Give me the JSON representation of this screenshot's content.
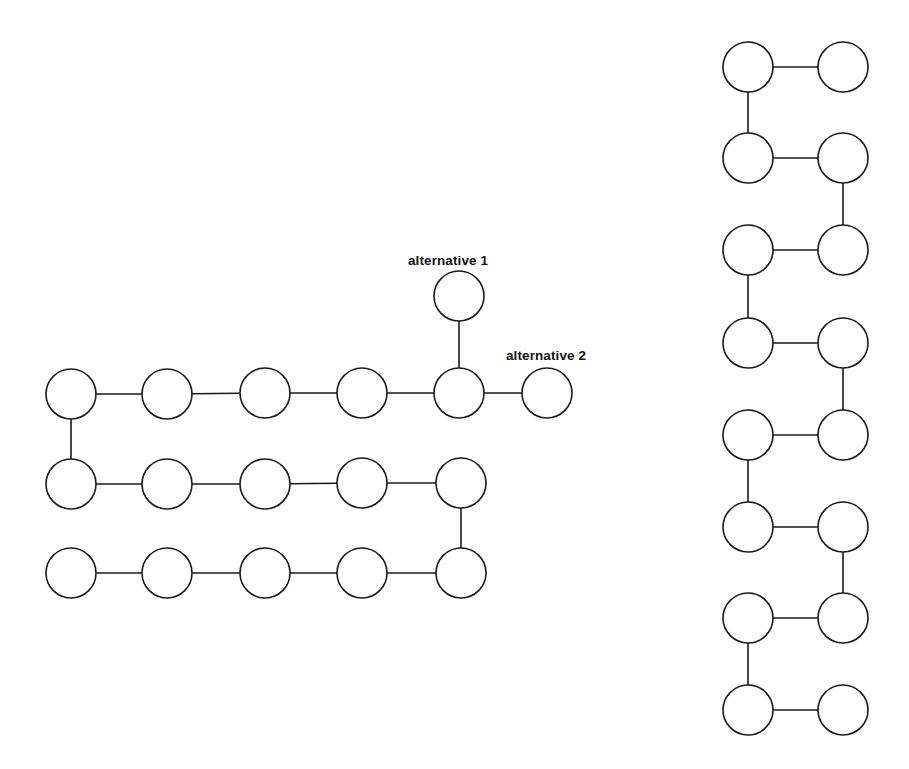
{
  "figure": {
    "title": "",
    "background_color": "#ffffff",
    "stroke_color": "#1a1a1a",
    "node_fill_color": "#ffffff",
    "node_radius": 25,
    "stroke_width": 1.6,
    "canvas": {
      "width": 909,
      "height": 769
    }
  },
  "labels": {
    "alternative_1": "alternative 1",
    "alternative_2": "alternative 2"
  },
  "chart_data": {
    "type": "diagram",
    "title": "",
    "graphs": [
      {
        "name": "left-boustrophedon-chain",
        "layout": "horizontal-serpentine",
        "rows": 3,
        "nodes": [
          {
            "id": "L-r1c1",
            "x": 71,
            "y": 394,
            "row": 1,
            "col": 1,
            "label": ""
          },
          {
            "id": "L-r1c2",
            "x": 167,
            "y": 394,
            "row": 1,
            "col": 2,
            "label": ""
          },
          {
            "id": "L-r1c3",
            "x": 265,
            "y": 393,
            "row": 1,
            "col": 3,
            "label": ""
          },
          {
            "id": "L-r1c4",
            "x": 362,
            "y": 393,
            "row": 1,
            "col": 4,
            "label": ""
          },
          {
            "id": "L-r1c5",
            "x": 459,
            "y": 393,
            "row": 1,
            "col": 5,
            "label": ""
          },
          {
            "id": "L-alt2",
            "x": 547,
            "y": 393,
            "row": 1,
            "col": 6,
            "label": "alternative 2"
          },
          {
            "id": "L-alt1",
            "x": 459,
            "y": 296,
            "row": 0,
            "col": 5,
            "label": "alternative 1"
          },
          {
            "id": "L-r2c1",
            "x": 71,
            "y": 484,
            "row": 2,
            "col": 1,
            "label": ""
          },
          {
            "id": "L-r2c2",
            "x": 167,
            "y": 484,
            "row": 2,
            "col": 2,
            "label": ""
          },
          {
            "id": "L-r2c3",
            "x": 265,
            "y": 484,
            "row": 2,
            "col": 3,
            "label": ""
          },
          {
            "id": "L-r2c4",
            "x": 362,
            "y": 483,
            "row": 2,
            "col": 4,
            "label": ""
          },
          {
            "id": "L-r2c5",
            "x": 461,
            "y": 483,
            "row": 2,
            "col": 5,
            "label": ""
          },
          {
            "id": "L-r3c1",
            "x": 71,
            "y": 573,
            "row": 3,
            "col": 1,
            "label": ""
          },
          {
            "id": "L-r3c2",
            "x": 167,
            "y": 573,
            "row": 3,
            "col": 2,
            "label": ""
          },
          {
            "id": "L-r3c3",
            "x": 265,
            "y": 573,
            "row": 3,
            "col": 3,
            "label": ""
          },
          {
            "id": "L-r3c4",
            "x": 362,
            "y": 573,
            "row": 3,
            "col": 4,
            "label": ""
          },
          {
            "id": "L-r3c5",
            "x": 461,
            "y": 573,
            "row": 3,
            "col": 5,
            "label": ""
          }
        ],
        "edges": [
          {
            "from": "L-r3c1",
            "to": "L-r3c2",
            "kind": "horizontal"
          },
          {
            "from": "L-r3c2",
            "to": "L-r3c3",
            "kind": "horizontal"
          },
          {
            "from": "L-r3c3",
            "to": "L-r3c4",
            "kind": "horizontal"
          },
          {
            "from": "L-r3c4",
            "to": "L-r3c5",
            "kind": "horizontal"
          },
          {
            "from": "L-r3c5",
            "to": "L-r2c5",
            "kind": "vertical"
          },
          {
            "from": "L-r2c5",
            "to": "L-r2c4",
            "kind": "horizontal"
          },
          {
            "from": "L-r2c4",
            "to": "L-r2c3",
            "kind": "horizontal"
          },
          {
            "from": "L-r2c3",
            "to": "L-r2c2",
            "kind": "horizontal"
          },
          {
            "from": "L-r2c2",
            "to": "L-r2c1",
            "kind": "horizontal"
          },
          {
            "from": "L-r2c1",
            "to": "L-r1c1",
            "kind": "vertical"
          },
          {
            "from": "L-r1c1",
            "to": "L-r1c2",
            "kind": "horizontal"
          },
          {
            "from": "L-r1c2",
            "to": "L-r1c3",
            "kind": "horizontal"
          },
          {
            "from": "L-r1c3",
            "to": "L-r1c4",
            "kind": "horizontal"
          },
          {
            "from": "L-r1c4",
            "to": "L-r1c5",
            "kind": "horizontal"
          },
          {
            "from": "L-r1c5",
            "to": "L-alt1",
            "kind": "vertical-branch"
          },
          {
            "from": "L-r1c5",
            "to": "L-alt2",
            "kind": "horizontal-branch"
          }
        ]
      },
      {
        "name": "right-serpentine-ladder",
        "layout": "vertical-serpentine",
        "rows": 8,
        "columns_x": [
          748,
          843
        ],
        "rows_y": [
          67,
          158,
          250,
          343,
          435,
          527,
          618,
          710
        ],
        "nodes": [
          {
            "id": "R-r1L",
            "x": 748,
            "y": 67,
            "row": 1,
            "col": "left",
            "label": ""
          },
          {
            "id": "R-r1R",
            "x": 843,
            "y": 67,
            "row": 1,
            "col": "right",
            "label": ""
          },
          {
            "id": "R-r2L",
            "x": 748,
            "y": 158,
            "row": 2,
            "col": "left",
            "label": ""
          },
          {
            "id": "R-r2R",
            "x": 843,
            "y": 158,
            "row": 2,
            "col": "right",
            "label": ""
          },
          {
            "id": "R-r3L",
            "x": 748,
            "y": 250,
            "row": 3,
            "col": "left",
            "label": ""
          },
          {
            "id": "R-r3R",
            "x": 843,
            "y": 250,
            "row": 3,
            "col": "right",
            "label": ""
          },
          {
            "id": "R-r4L",
            "x": 748,
            "y": 343,
            "row": 4,
            "col": "left",
            "label": ""
          },
          {
            "id": "R-r4R",
            "x": 843,
            "y": 343,
            "row": 4,
            "col": "right",
            "label": ""
          },
          {
            "id": "R-r5L",
            "x": 748,
            "y": 435,
            "row": 5,
            "col": "left",
            "label": ""
          },
          {
            "id": "R-r5R",
            "x": 843,
            "y": 435,
            "row": 5,
            "col": "right",
            "label": ""
          },
          {
            "id": "R-r6L",
            "x": 748,
            "y": 527,
            "row": 6,
            "col": "left",
            "label": ""
          },
          {
            "id": "R-r6R",
            "x": 843,
            "y": 527,
            "row": 6,
            "col": "right",
            "label": ""
          },
          {
            "id": "R-r7L",
            "x": 748,
            "y": 618,
            "row": 7,
            "col": "left",
            "label": ""
          },
          {
            "id": "R-r7R",
            "x": 843,
            "y": 618,
            "row": 7,
            "col": "right",
            "label": ""
          },
          {
            "id": "R-r8L",
            "x": 748,
            "y": 710,
            "row": 8,
            "col": "left",
            "label": ""
          },
          {
            "id": "R-r8R",
            "x": 843,
            "y": 710,
            "row": 8,
            "col": "right",
            "label": ""
          }
        ],
        "edges": [
          {
            "from": "R-r1R",
            "to": "R-r1L",
            "kind": "horizontal"
          },
          {
            "from": "R-r1L",
            "to": "R-r2L",
            "kind": "vertical"
          },
          {
            "from": "R-r2L",
            "to": "R-r2R",
            "kind": "horizontal"
          },
          {
            "from": "R-r2R",
            "to": "R-r3R",
            "kind": "vertical"
          },
          {
            "from": "R-r3R",
            "to": "R-r3L",
            "kind": "horizontal"
          },
          {
            "from": "R-r3L",
            "to": "R-r4L",
            "kind": "vertical"
          },
          {
            "from": "R-r4L",
            "to": "R-r4R",
            "kind": "horizontal"
          },
          {
            "from": "R-r4R",
            "to": "R-r5R",
            "kind": "vertical"
          },
          {
            "from": "R-r5R",
            "to": "R-r5L",
            "kind": "horizontal"
          },
          {
            "from": "R-r5L",
            "to": "R-r6L",
            "kind": "vertical"
          },
          {
            "from": "R-r6L",
            "to": "R-r6R",
            "kind": "horizontal"
          },
          {
            "from": "R-r6R",
            "to": "R-r7R",
            "kind": "vertical"
          },
          {
            "from": "R-r7R",
            "to": "R-r7L",
            "kind": "horizontal"
          },
          {
            "from": "R-r7L",
            "to": "R-r8L",
            "kind": "vertical"
          },
          {
            "from": "R-r8L",
            "to": "R-r8R",
            "kind": "horizontal"
          }
        ]
      }
    ],
    "annotations": [
      {
        "id": "ann-alt1",
        "text": "alternative 1",
        "x": 408,
        "y": 265,
        "anchor": "start",
        "points_to": "L-alt1"
      },
      {
        "id": "ann-alt2",
        "text": "alternative 2",
        "x": 506,
        "y": 360,
        "anchor": "start",
        "points_to": "L-alt2"
      }
    ]
  }
}
